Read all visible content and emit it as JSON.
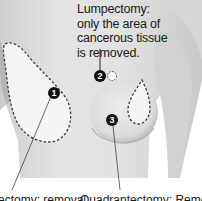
{
  "diagram": {
    "callout_top": {
      "lines": [
        "Lumpectomy:",
        "only the area of",
        "cancerous tissue",
        "is removed."
      ]
    },
    "markers": [
      {
        "number": "1",
        "label": "mastectomy area"
      },
      {
        "number": "2",
        "label": "lumpectomy area"
      },
      {
        "number": "3",
        "label": "quadrantectomy area"
      }
    ],
    "bottom_labels": {
      "left": "ectomy: removal",
      "right": "Quadrantectomy: Removal"
    },
    "colors": {
      "skin_light": "#e6e6e6",
      "skin_shadow": "#bdbdbd",
      "excised_area": "#f4f4f4",
      "dashed_outline": "#3a3a3a",
      "marker": "#111111"
    }
  }
}
